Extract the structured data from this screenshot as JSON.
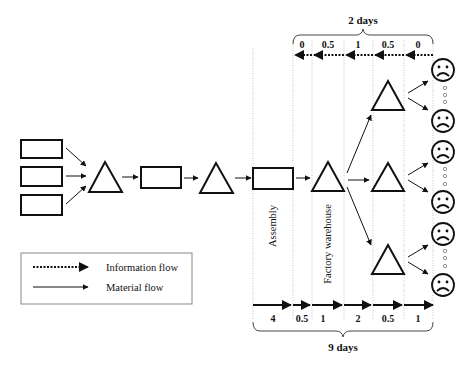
{
  "diagram": {
    "top_span_label": "2 days",
    "bottom_span_label": "9 days",
    "info_flow_segments": [
      "0",
      "0.5",
      "1",
      "0.5",
      "0"
    ],
    "material_flow_segments": [
      "4",
      "0.5",
      "1",
      "2",
      "0.5",
      "1"
    ],
    "stage_labels": {
      "assembly": "Assembly",
      "factory_warehouse": "Factory warehouse"
    },
    "customer_icon": "sad-face-icon",
    "customer_count": 6
  },
  "legend": {
    "information_flow": "Information flow",
    "material_flow": "Material flow"
  },
  "colors": {
    "stroke": "#111111",
    "divider": "#b0b0b0",
    "background": "#ffffff"
  }
}
